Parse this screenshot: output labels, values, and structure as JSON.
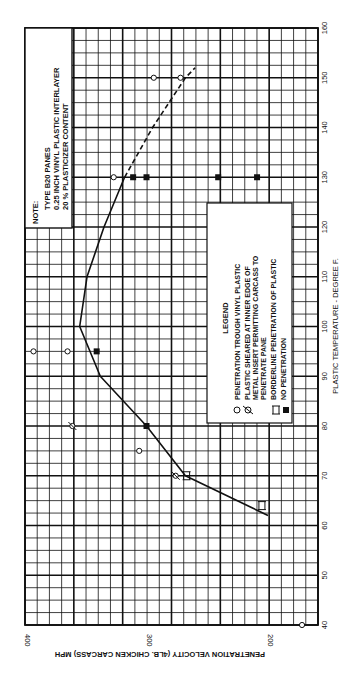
{
  "chart_data": {
    "type": "scatter",
    "title": "",
    "xlabel": "PLASTIC TEMPERATURE - DEGREE F.",
    "ylabel": "PENETRATION VELOCITY (4LB. CHICKEN CARCASS) MPH",
    "x_ticks": [
      40,
      50,
      60,
      70,
      80,
      90,
      100,
      110,
      120,
      130,
      140,
      150,
      160
    ],
    "y_ticks": [
      200,
      300,
      400
    ],
    "xlim": [
      40,
      160
    ],
    "ylim": [
      160,
      400
    ],
    "grid": true,
    "orientation": "rotated 90 degrees counter-clockwise",
    "note": {
      "title": "NOTE:",
      "lines": [
        "TYPE B20 PANES",
        "0.25 INCH VINYL PLASTIC INTERLAYER",
        "20 % PLASTICIZER CONTENT"
      ]
    },
    "legend": {
      "title": "LEGEND",
      "entries": [
        {
          "symbol": "open-circle",
          "label": "PENETRATION TROUGH VINYL PLASTIC"
        },
        {
          "symbol": "slashed-circle",
          "label": "PLASTIC SHEARED AT INNER EDGE OF METAL INSERT PERMITTING CARCASS TO PENETRATE PANE"
        },
        {
          "symbol": "borderline-marker",
          "label": "BORDERLINE PENETRATION OF PLASTIC"
        },
        {
          "symbol": "filled-square",
          "label": "NO PENETRATION"
        }
      ]
    },
    "series": [
      {
        "name": "PENETRATION TROUGH VINYL PLASTIC",
        "marker": "open-circle",
        "points": [
          [
            40,
            172
          ],
          [
            75,
            306
          ],
          [
            95,
            393
          ],
          [
            95,
            365
          ],
          [
            130,
            327
          ],
          [
            150,
            294
          ],
          [
            150,
            272
          ]
        ]
      },
      {
        "name": "PLASTIC SHEARED AT INNER EDGE OF METAL INSERT",
        "marker": "slashed-circle",
        "points": [
          [
            70,
            276
          ],
          [
            80,
            361
          ]
        ]
      },
      {
        "name": "BORDERLINE PENETRATION OF PLASTIC",
        "marker": "borderline-marker",
        "points": [
          [
            70,
            267
          ],
          [
            64,
            205
          ]
        ]
      },
      {
        "name": "NO PENETRATION",
        "marker": "filled-square",
        "points": [
          [
            80,
            300
          ],
          [
            95,
            341
          ],
          [
            130,
            311
          ],
          [
            130,
            300
          ],
          [
            130,
            241
          ],
          [
            130,
            209
          ]
        ]
      }
    ],
    "curve": {
      "name": "penetration boundary",
      "solid": [
        [
          62,
          200
        ],
        [
          70,
          268
        ],
        [
          80,
          300
        ],
        [
          90,
          338
        ],
        [
          100,
          355
        ],
        [
          110,
          349
        ],
        [
          120,
          335
        ],
        [
          130,
          318
        ]
      ],
      "dashed": [
        [
          130,
          318
        ],
        [
          140,
          295
        ],
        [
          150,
          268
        ],
        [
          152,
          260
        ]
      ]
    }
  }
}
